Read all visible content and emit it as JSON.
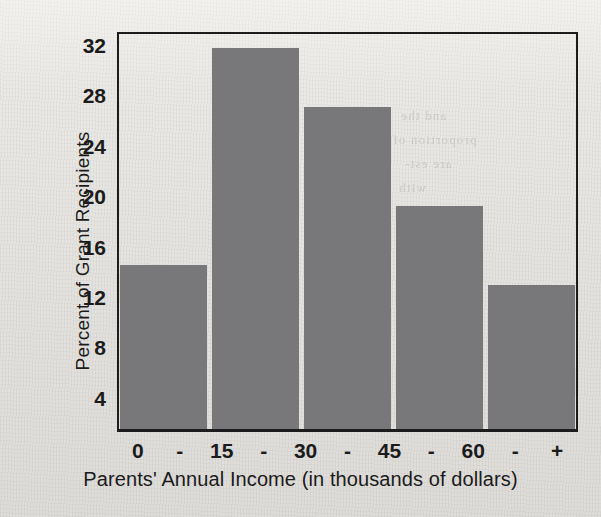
{
  "chart_data": {
    "type": "bar",
    "title": "",
    "xlabel": "Parents' Annual Income (in thousands of dollars)",
    "ylabel": "Percent of Grant Recipients",
    "categories": [
      "0 - 15",
      "15 - 30",
      "30 - 45",
      "45 - 60",
      "60 - +"
    ],
    "values": [
      14.3,
      31.5,
      26.8,
      19.0,
      12.7
    ],
    "ylim": [
      1.3,
      33.0
    ],
    "yticks": [
      4,
      8,
      12,
      16,
      20,
      24,
      28,
      32
    ],
    "ytick_labels": [
      "4",
      "8",
      "12",
      "16",
      "20",
      "24",
      "28",
      "32"
    ],
    "xtick_labels": [
      "0",
      "-",
      "15",
      "-",
      "30",
      "-",
      "45",
      "-",
      "60",
      "-",
      "+"
    ],
    "grid": false,
    "legend": false,
    "bar_color": "#78787b",
    "axis_color": "#1b1b1b",
    "background_color": "#e9e7e3"
  },
  "axes": {
    "y_title": "Percent of Grant Recipients",
    "x_title": "Parents' Annual Income (in thousands of dollars)",
    "y_ticks": [
      {
        "label": "32",
        "value": 32
      },
      {
        "label": "28",
        "value": 28
      },
      {
        "label": "24",
        "value": 24
      },
      {
        "label": "20",
        "value": 20
      },
      {
        "label": "16",
        "value": 16
      },
      {
        "label": "12",
        "value": 12
      },
      {
        "label": "8",
        "value": 8
      },
      {
        "label": "4",
        "value": 4
      }
    ],
    "x_ticks": [
      {
        "label": "0"
      },
      {
        "label": "-"
      },
      {
        "label": "15"
      },
      {
        "label": "-"
      },
      {
        "label": "30"
      },
      {
        "label": "-"
      },
      {
        "label": "45"
      },
      {
        "label": "-"
      },
      {
        "label": "60"
      },
      {
        "label": "-"
      },
      {
        "label": "+"
      }
    ]
  },
  "bleed_text": {
    "line1": "and the",
    "line2": "proportion of",
    "line3": "are est-",
    "line4": "with",
    "line5": "of"
  }
}
